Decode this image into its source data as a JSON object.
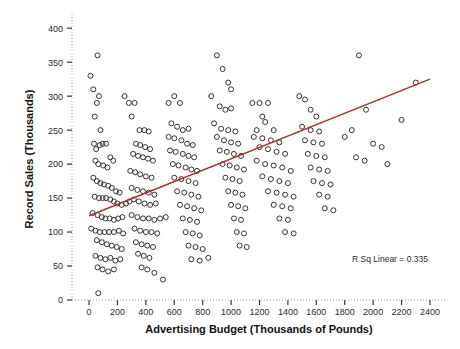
{
  "chart_data": {
    "type": "scatter",
    "title": "",
    "xlabel": "Advertising Budget (Thousands of Pounds)",
    "ylabel": "Record Sales (Thousands)",
    "xlim": [
      -120,
      2520
    ],
    "ylim": [
      0,
      415
    ],
    "xticks": [
      0,
      200,
      400,
      600,
      800,
      1000,
      1200,
      1400,
      1600,
      1800,
      2000,
      2200,
      2400
    ],
    "yticks": [
      0,
      50,
      100,
      150,
      200,
      250,
      300,
      350,
      400
    ],
    "xtick_labels": [
      "0",
      "200",
      "400",
      "600",
      "800",
      "1000",
      "1200",
      "1400",
      "1600",
      "1800",
      "2000",
      "2200",
      "2400"
    ],
    "ytick_labels": [
      "0",
      "50",
      "100",
      "150",
      "200",
      "250",
      "300",
      "350",
      "400"
    ],
    "grid": false,
    "legend": null,
    "annotation": "R Sq Linear = 0.335",
    "marker": {
      "shape": "circle-open",
      "size": 5,
      "edge_color": "#333333",
      "face_color": "#ffffff"
    },
    "fit_line": {
      "type": "linear",
      "color": "#a83232",
      "r_squared": 0.335,
      "x_start": 0,
      "y_start": 124,
      "x_end": 2400,
      "y_end": 325
    },
    "points": [
      [
        10,
        330
      ],
      [
        30,
        310
      ],
      [
        60,
        360
      ],
      [
        70,
        300
      ],
      [
        55,
        290
      ],
      [
        40,
        270
      ],
      [
        80,
        250
      ],
      [
        35,
        230
      ],
      [
        50,
        222
      ],
      [
        75,
        228
      ],
      [
        95,
        230
      ],
      [
        120,
        230
      ],
      [
        45,
        205
      ],
      [
        65,
        200
      ],
      [
        100,
        198
      ],
      [
        130,
        195
      ],
      [
        150,
        210
      ],
      [
        170,
        205
      ],
      [
        30,
        180
      ],
      [
        55,
        175
      ],
      [
        80,
        172
      ],
      [
        105,
        170
      ],
      [
        135,
        168
      ],
      [
        160,
        165
      ],
      [
        190,
        160
      ],
      [
        215,
        158
      ],
      [
        40,
        152
      ],
      [
        70,
        150
      ],
      [
        95,
        150
      ],
      [
        120,
        150
      ],
      [
        150,
        148
      ],
      [
        175,
        145
      ],
      [
        200,
        142
      ],
      [
        230,
        140
      ],
      [
        260,
        142
      ],
      [
        285,
        145
      ],
      [
        25,
        128
      ],
      [
        60,
        125
      ],
      [
        90,
        122
      ],
      [
        115,
        120
      ],
      [
        145,
        120
      ],
      [
        175,
        118
      ],
      [
        205,
        120
      ],
      [
        235,
        122
      ],
      [
        15,
        105
      ],
      [
        45,
        102
      ],
      [
        75,
        100
      ],
      [
        110,
        100
      ],
      [
        140,
        100
      ],
      [
        175,
        100
      ],
      [
        210,
        102
      ],
      [
        240,
        98
      ],
      [
        55,
        88
      ],
      [
        90,
        85
      ],
      [
        125,
        82
      ],
      [
        160,
        80
      ],
      [
        195,
        78
      ],
      [
        230,
        75
      ],
      [
        45,
        65
      ],
      [
        80,
        62
      ],
      [
        115,
        60
      ],
      [
        150,
        62
      ],
      [
        185,
        58
      ],
      [
        220,
        60
      ],
      [
        60,
        48
      ],
      [
        95,
        45
      ],
      [
        135,
        42
      ],
      [
        175,
        45
      ],
      [
        65,
        10
      ],
      [
        250,
        300
      ],
      [
        280,
        290
      ],
      [
        320,
        290
      ],
      [
        300,
        270
      ],
      [
        355,
        250
      ],
      [
        390,
        250
      ],
      [
        420,
        248
      ],
      [
        330,
        230
      ],
      [
        360,
        228
      ],
      [
        395,
        225
      ],
      [
        430,
        222
      ],
      [
        310,
        215
      ],
      [
        345,
        212
      ],
      [
        380,
        210
      ],
      [
        415,
        208
      ],
      [
        450,
        205
      ],
      [
        290,
        190
      ],
      [
        325,
        188
      ],
      [
        360,
        185
      ],
      [
        400,
        182
      ],
      [
        440,
        180
      ],
      [
        300,
        165
      ],
      [
        340,
        162
      ],
      [
        380,
        160
      ],
      [
        420,
        158
      ],
      [
        460,
        155
      ],
      [
        315,
        148
      ],
      [
        350,
        145
      ],
      [
        390,
        142
      ],
      [
        430,
        140
      ],
      [
        470,
        142
      ],
      [
        300,
        125
      ],
      [
        340,
        122
      ],
      [
        380,
        120
      ],
      [
        420,
        120
      ],
      [
        460,
        118
      ],
      [
        320,
        105
      ],
      [
        360,
        102
      ],
      [
        400,
        100
      ],
      [
        440,
        100
      ],
      [
        480,
        98
      ],
      [
        330,
        85
      ],
      [
        370,
        82
      ],
      [
        410,
        80
      ],
      [
        450,
        78
      ],
      [
        345,
        68
      ],
      [
        385,
        65
      ],
      [
        425,
        62
      ],
      [
        370,
        48
      ],
      [
        410,
        45
      ],
      [
        460,
        40
      ],
      [
        520,
        30
      ],
      [
        500,
        120
      ],
      [
        540,
        122
      ],
      [
        560,
        290
      ],
      [
        600,
        300
      ],
      [
        640,
        290
      ],
      [
        580,
        260
      ],
      [
        620,
        255
      ],
      [
        660,
        250
      ],
      [
        700,
        252
      ],
      [
        560,
        240
      ],
      [
        600,
        238
      ],
      [
        650,
        235
      ],
      [
        690,
        230
      ],
      [
        730,
        228
      ],
      [
        570,
        220
      ],
      [
        610,
        218
      ],
      [
        660,
        215
      ],
      [
        700,
        212
      ],
      [
        740,
        210
      ],
      [
        590,
        200
      ],
      [
        630,
        198
      ],
      [
        680,
        195
      ],
      [
        720,
        192
      ],
      [
        760,
        190
      ],
      [
        600,
        180
      ],
      [
        650,
        178
      ],
      [
        700,
        175
      ],
      [
        750,
        172
      ],
      [
        620,
        160
      ],
      [
        670,
        158
      ],
      [
        720,
        155
      ],
      [
        770,
        152
      ],
      [
        640,
        140
      ],
      [
        690,
        138
      ],
      [
        740,
        135
      ],
      [
        790,
        132
      ],
      [
        660,
        120
      ],
      [
        710,
        118
      ],
      [
        760,
        115
      ],
      [
        680,
        100
      ],
      [
        730,
        98
      ],
      [
        780,
        95
      ],
      [
        700,
        80
      ],
      [
        750,
        78
      ],
      [
        800,
        75
      ],
      [
        720,
        60
      ],
      [
        780,
        58
      ],
      [
        840,
        62
      ],
      [
        900,
        360
      ],
      [
        940,
        340
      ],
      [
        980,
        320
      ],
      [
        1000,
        310
      ],
      [
        860,
        300
      ],
      [
        920,
        285
      ],
      [
        960,
        280
      ],
      [
        1000,
        282
      ],
      [
        880,
        260
      ],
      [
        930,
        252
      ],
      [
        980,
        250
      ],
      [
        1030,
        248
      ],
      [
        900,
        240
      ],
      [
        950,
        235
      ],
      [
        1000,
        232
      ],
      [
        1050,
        230
      ],
      [
        920,
        220
      ],
      [
        970,
        218
      ],
      [
        1020,
        215
      ],
      [
        1070,
        212
      ],
      [
        940,
        200
      ],
      [
        990,
        198
      ],
      [
        1040,
        195
      ],
      [
        1090,
        192
      ],
      [
        960,
        180
      ],
      [
        1010,
        178
      ],
      [
        1060,
        175
      ],
      [
        980,
        160
      ],
      [
        1030,
        158
      ],
      [
        1080,
        155
      ],
      [
        1000,
        140
      ],
      [
        1050,
        138
      ],
      [
        1100,
        135
      ],
      [
        1020,
        120
      ],
      [
        1070,
        118
      ],
      [
        1040,
        100
      ],
      [
        1090,
        98
      ],
      [
        1060,
        80
      ],
      [
        1110,
        78
      ],
      [
        1150,
        290
      ],
      [
        1200,
        290
      ],
      [
        1260,
        290
      ],
      [
        1220,
        270
      ],
      [
        1240,
        262
      ],
      [
        1180,
        250
      ],
      [
        1300,
        250
      ],
      [
        1160,
        240
      ],
      [
        1220,
        238
      ],
      [
        1280,
        235
      ],
      [
        1340,
        232
      ],
      [
        1200,
        225
      ],
      [
        1260,
        222
      ],
      [
        1320,
        218
      ],
      [
        1380,
        215
      ],
      [
        1180,
        205
      ],
      [
        1240,
        200
      ],
      [
        1300,
        198
      ],
      [
        1360,
        195
      ],
      [
        1420,
        190
      ],
      [
        1220,
        182
      ],
      [
        1280,
        178
      ],
      [
        1340,
        175
      ],
      [
        1400,
        172
      ],
      [
        1260,
        160
      ],
      [
        1320,
        158
      ],
      [
        1380,
        155
      ],
      [
        1440,
        152
      ],
      [
        1300,
        140
      ],
      [
        1360,
        138
      ],
      [
        1420,
        135
      ],
      [
        1340,
        120
      ],
      [
        1400,
        118
      ],
      [
        1380,
        100
      ],
      [
        1440,
        98
      ],
      [
        1480,
        300
      ],
      [
        1520,
        295
      ],
      [
        1560,
        280
      ],
      [
        1600,
        270
      ],
      [
        1500,
        255
      ],
      [
        1560,
        250
      ],
      [
        1620,
        248
      ],
      [
        1520,
        235
      ],
      [
        1580,
        232
      ],
      [
        1640,
        230
      ],
      [
        1540,
        215
      ],
      [
        1600,
        212
      ],
      [
        1660,
        210
      ],
      [
        1560,
        195
      ],
      [
        1620,
        192
      ],
      [
        1680,
        190
      ],
      [
        1580,
        175
      ],
      [
        1640,
        172
      ],
      [
        1700,
        170
      ],
      [
        1620,
        155
      ],
      [
        1680,
        152
      ],
      [
        1660,
        135
      ],
      [
        1720,
        132
      ],
      [
        1900,
        360
      ],
      [
        1950,
        280
      ],
      [
        1850,
        250
      ],
      [
        1800,
        240
      ],
      [
        2000,
        230
      ],
      [
        2060,
        225
      ],
      [
        1880,
        210
      ],
      [
        1940,
        205
      ],
      [
        2100,
        200
      ],
      [
        2200,
        265
      ],
      [
        2300,
        320
      ]
    ]
  },
  "layout": {
    "plot_left_px": 72,
    "plot_right_px": 447,
    "plot_top_px": 18,
    "plot_bottom_px": 300,
    "annotation_x_px": 390,
    "annotation_y_px": 262
  }
}
